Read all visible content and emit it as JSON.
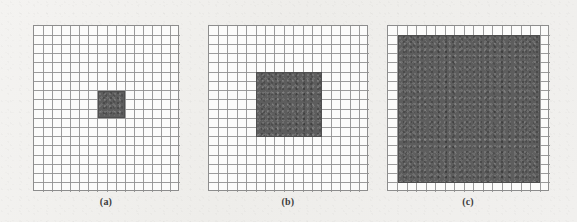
{
  "figure": {
    "background_color": "#f2f1ef",
    "grid_line_color": "#909090",
    "grid_fill_color": "#fbfbfa",
    "shade_color": "#5d5d5d",
    "caption_color": "#3c3c3c",
    "panels": [
      {
        "id": "panel-a",
        "caption": "(a)",
        "x": 33,
        "y": 25,
        "width": 146,
        "height": 166,
        "cols": 16,
        "rows": 18,
        "shaded_region": {
          "col_start": 7,
          "col_end": 10,
          "row_start": 7,
          "row_end": 10,
          "cols_shaded": 3,
          "rows_shaded": 3
        }
      },
      {
        "id": "panel-b",
        "caption": "(b)",
        "x": 208,
        "y": 25,
        "width": 160,
        "height": 166,
        "cols": 17,
        "rows": 18,
        "shaded_region": {
          "col_start": 5,
          "col_end": 12,
          "row_start": 5,
          "row_end": 12,
          "cols_shaded": 7,
          "rows_shaded": 7
        }
      },
      {
        "id": "panel-c",
        "caption": "(c)",
        "x": 387,
        "y": 25,
        "width": 162,
        "height": 166,
        "cols": 17,
        "rows": 18,
        "shaded_region": {
          "col_start": 1,
          "col_end": 16,
          "row_start": 1,
          "row_end": 17,
          "cols_shaded": 15,
          "rows_shaded": 16
        }
      }
    ],
    "caption_baseline_y": 196
  }
}
